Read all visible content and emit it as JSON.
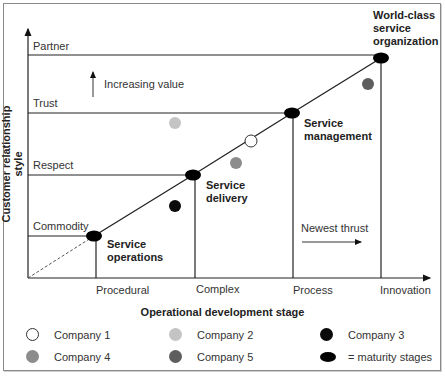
{
  "axes": {
    "y_label": "Customer relationship style",
    "x_label": "Operational development stage",
    "y_levels": [
      "Commodity",
      "Respect",
      "Trust",
      "Partner"
    ],
    "x_stages": [
      "Procedural",
      "Complex",
      "Process",
      "Innovation"
    ]
  },
  "annotations": {
    "increasing_value": "Increasing value",
    "newest_thrust": "Newest thrust"
  },
  "maturity_stages": [
    {
      "line1": "Service",
      "line2": "operations"
    },
    {
      "line1": "Service",
      "line2": "delivery"
    },
    {
      "line1": "Service",
      "line2": "management"
    },
    {
      "line1": "World-class",
      "line2": "service",
      "line3": "organization"
    }
  ],
  "legend": {
    "items": [
      {
        "label": "Company 1",
        "color": "#ffffff"
      },
      {
        "label": "Company 2",
        "color": "#c4c4c4"
      },
      {
        "label": "Company 3",
        "color": "#0a0a0a"
      },
      {
        "label": "Company 4",
        "color": "#8c8c8c"
      },
      {
        "label": "Company 5",
        "color": "#5e5e5e"
      },
      {
        "label": "= maturity stages",
        "color": "#000000"
      }
    ]
  }
}
